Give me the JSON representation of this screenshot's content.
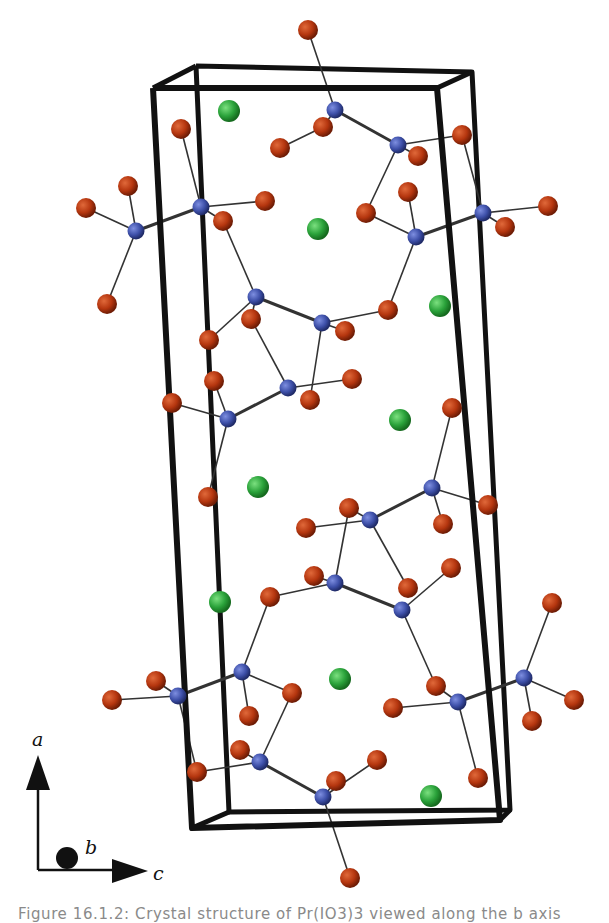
{
  "figure": {
    "caption": "Figure 16.1.2: Crystal structure of Pr(IO3)3 viewed along the b axis",
    "colors": {
      "oxygen": "#b5360f",
      "iodine": "#3d4fa8",
      "metal": "#2aa23a",
      "cell_edge": "#111111",
      "bond": "#333333"
    },
    "axes": {
      "a_label": "a",
      "b_label": "b",
      "c_label": "c"
    },
    "unit_cell": {
      "front": [
        [
          153,
          88
        ],
        [
          437,
          88
        ],
        [
          500,
          820
        ],
        [
          192,
          828
        ]
      ],
      "back": [
        [
          196,
          66
        ],
        [
          472,
          72
        ],
        [
          510,
          810
        ],
        [
          229,
          812
        ]
      ]
    },
    "legend_atoms": [
      {
        "element": "O",
        "color_key": "oxygen"
      },
      {
        "element": "I",
        "color_key": "iodine"
      },
      {
        "element": "metal",
        "color_key": "metal"
      }
    ]
  }
}
